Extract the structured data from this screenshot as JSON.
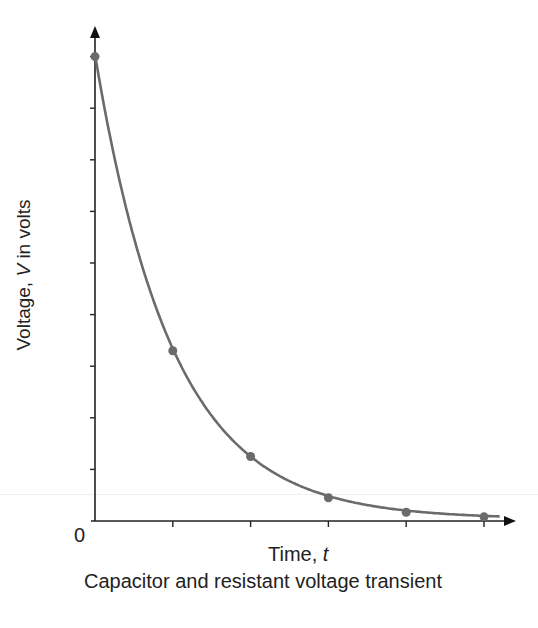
{
  "chart_data": {
    "type": "line",
    "title": "Capacitor and resistant voltage transient",
    "xlabel": "Time, t",
    "ylabel": "Voltage, V in volts",
    "origin_label": "0",
    "x": [
      0,
      1,
      2,
      3,
      4,
      5
    ],
    "series": [
      {
        "name": "Voltage",
        "values": [
          9,
          3.3,
          1.25,
          0.45,
          0.17,
          0.08
        ],
        "color": "#6b6b6b"
      }
    ],
    "x_ticks": 6,
    "y_ticks": 10,
    "xlim": [
      0,
      5.4
    ],
    "ylim": [
      0,
      9.5
    ],
    "grid": false,
    "legend": "none"
  },
  "labels": {
    "ylabel_prefix": "Voltage, ",
    "ylabel_var": "V",
    "ylabel_suffix": " in volts",
    "xlabel_prefix": "Time, ",
    "xlabel_var": "t",
    "origin": "0",
    "caption": "Capacitor and resistant voltage transient",
    "cut_text": "· · ·"
  }
}
